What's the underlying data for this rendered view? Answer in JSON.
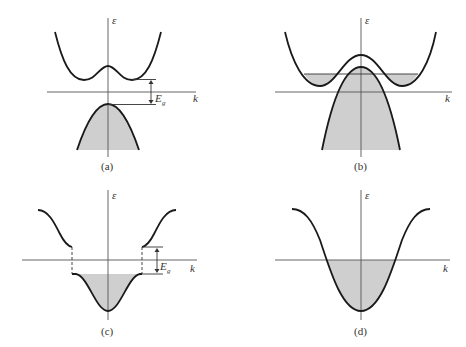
{
  "figure": {
    "axis_labels": {
      "y": "ε",
      "x": "k"
    },
    "gap_label": {
      "main": "E",
      "sub": "g"
    },
    "panels": [
      {
        "id": "a",
        "caption": "(a)",
        "description": "Semiconductor: conduction band with double minimum above, filled valence band below, separated by energy gap E_g"
      },
      {
        "id": "b",
        "caption": "(b)",
        "description": "Semimetal: conduction band minima dip below top of valence band; overlapping partially filled bands"
      },
      {
        "id": "c",
        "caption": "(c)",
        "description": "Insulator/semiconductor with filled lower band and gap E_g to upper band"
      },
      {
        "id": "d",
        "caption": "(d)",
        "description": "Metal: single cosine band, partially filled below Fermi level"
      }
    ],
    "colors": {
      "fill": "#cfcfcf",
      "curve": "#1a1a1a",
      "axis": "#555555"
    }
  }
}
